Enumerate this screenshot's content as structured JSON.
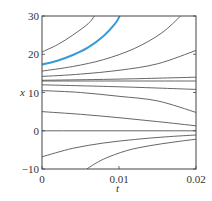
{
  "chart_data": {
    "type": "line",
    "title": "",
    "xlabel": "t",
    "ylabel": "x",
    "xlim": [
      0,
      0.02
    ],
    "ylim": [
      -10,
      30
    ],
    "xticks": [
      0,
      0.01,
      0.02
    ],
    "xtick_labels": [
      "0",
      "0.01",
      "0.02"
    ],
    "yticks": [
      -10,
      0,
      10,
      20,
      30
    ],
    "ytick_labels": [
      "−10",
      "0",
      "10",
      "20",
      "30"
    ],
    "grid": false,
    "legend": null,
    "highlight_color": "#3a9ad9",
    "line_color": "#555555",
    "series": [
      {
        "name": "x0=20",
        "highlight": false,
        "points": [
          [
            0,
            20.6
          ],
          [
            0.002,
            22.5
          ],
          [
            0.004,
            25
          ],
          [
            0.006,
            28
          ],
          [
            0.0068,
            30
          ]
        ]
      },
      {
        "name": "x0=17",
        "highlight": true,
        "points": [
          [
            0,
            17.3
          ],
          [
            0.002,
            18.3
          ],
          [
            0.004,
            19.8
          ],
          [
            0.006,
            21.8
          ],
          [
            0.008,
            24.8
          ],
          [
            0.0095,
            28
          ],
          [
            0.0101,
            30
          ]
        ]
      },
      {
        "name": "x0=16",
        "highlight": false,
        "points": [
          [
            0,
            15.6
          ],
          [
            0.004,
            16.8
          ],
          [
            0.008,
            18.6
          ],
          [
            0.012,
            21.5
          ],
          [
            0.0155,
            25.5
          ],
          [
            0.018,
            30
          ]
        ]
      },
      {
        "name": "x0=14",
        "highlight": false,
        "points": [
          [
            0,
            14.2
          ],
          [
            0.005,
            14.8
          ],
          [
            0.01,
            15.8
          ],
          [
            0.015,
            17.5
          ],
          [
            0.02,
            21
          ]
        ]
      },
      {
        "name": "x0=13.2",
        "highlight": false,
        "points": [
          [
            0,
            13.2
          ],
          [
            0.01,
            13.5
          ],
          [
            0.02,
            14
          ]
        ]
      },
      {
        "name": "x0=13",
        "highlight": false,
        "points": [
          [
            0,
            13
          ],
          [
            0.02,
            13
          ]
        ]
      },
      {
        "name": "x0=12",
        "highlight": false,
        "points": [
          [
            0,
            12
          ],
          [
            0.01,
            11.5
          ],
          [
            0.02,
            10.8
          ]
        ]
      },
      {
        "name": "x0=10.5",
        "highlight": false,
        "points": [
          [
            0,
            10.5
          ],
          [
            0.005,
            10
          ],
          [
            0.01,
            9
          ],
          [
            0.015,
            7.8
          ],
          [
            0.02,
            4.8
          ]
        ]
      },
      {
        "name": "x0=5",
        "highlight": false,
        "points": [
          [
            0,
            5
          ],
          [
            0.005,
            4.3
          ],
          [
            0.01,
            3.4
          ],
          [
            0.015,
            2.4
          ],
          [
            0.02,
            1.3
          ]
        ]
      },
      {
        "name": "x0=0",
        "highlight": false,
        "points": [
          [
            0,
            0
          ],
          [
            0.02,
            0
          ]
        ]
      },
      {
        "name": "x0=-7",
        "highlight": false,
        "points": [
          [
            0,
            -6.8
          ],
          [
            0.004,
            -4.6
          ],
          [
            0.008,
            -3.2
          ],
          [
            0.012,
            -2.3
          ],
          [
            0.016,
            -1.6
          ],
          [
            0.02,
            -1.1
          ]
        ]
      },
      {
        "name": "x0=-10",
        "highlight": false,
        "points": [
          [
            0.0058,
            -10
          ],
          [
            0.008,
            -7.4
          ],
          [
            0.011,
            -5.2
          ],
          [
            0.014,
            -3.9
          ],
          [
            0.017,
            -3.0
          ],
          [
            0.02,
            -2.2
          ]
        ]
      }
    ]
  },
  "plot": {
    "ylabel": "x",
    "xlabel": "t"
  }
}
